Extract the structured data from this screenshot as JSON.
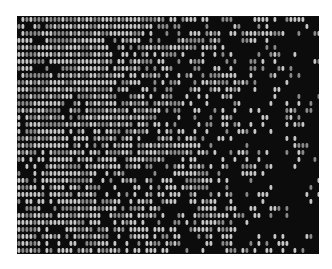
{
  "image": {
    "subject": "woven fabric texture",
    "description": "Grayscale close-up of a woven textile with regular light-grey weave stitches on the left fading into irregular black damaged/dark patches toward the right and bottom",
    "colors": {
      "background": "#ffffff",
      "thread_light": "#c8c8c8",
      "thread_mid": "#8a8a8a",
      "dark_patch": "#0c0c0c"
    },
    "bounds": {
      "x": 17,
      "y": 16,
      "width": 302,
      "height": 238
    }
  }
}
